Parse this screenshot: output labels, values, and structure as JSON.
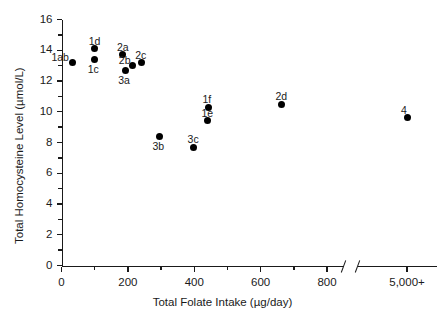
{
  "chart_data": {
    "type": "scatter",
    "title": "",
    "xlabel": "Total Folate Intake (µg/day)",
    "ylabel": "Total Homocysteine Level (µmol/L)",
    "xlim": [
      0,
      900
    ],
    "ylim": [
      0,
      16
    ],
    "grid": false,
    "legend": null,
    "axis_break": {
      "present": true,
      "after": 800,
      "resumes_at_label": "5,000+"
    },
    "x_ticks_major": [
      0,
      200,
      400,
      600,
      800
    ],
    "x_tick_labels": [
      "0",
      "200",
      "400",
      "600",
      "800",
      "5,000+"
    ],
    "x_ticks_minor": [
      100,
      300,
      500,
      700
    ],
    "y_ticks_major": [
      0,
      2,
      4,
      6,
      8,
      10,
      12,
      14,
      16
    ],
    "y_tick_labels": [
      "0",
      "2",
      "4",
      "6",
      "8",
      "10",
      "12",
      "14",
      "16"
    ],
    "y_ticks_minor": [
      1,
      3,
      5,
      7,
      9,
      11,
      13,
      15
    ],
    "points": [
      {
        "label": "1ab",
        "x": 33,
        "y": 13.2,
        "label_pos": "left"
      },
      {
        "label": "1d",
        "x": 100,
        "y": 14.1,
        "label_pos": "top"
      },
      {
        "label": "1c",
        "x": 100,
        "y": 13.4,
        "label_pos": "bottom"
      },
      {
        "label": "2a",
        "x": 185,
        "y": 13.7,
        "label_pos": "top"
      },
      {
        "label": "2b",
        "x": 215,
        "y": 13.0,
        "label_pos": "topleft"
      },
      {
        "label": "2c",
        "x": 240,
        "y": 13.2,
        "label_pos": "top"
      },
      {
        "label": "3a",
        "x": 192,
        "y": 12.7,
        "label_pos": "bottom"
      },
      {
        "label": "3b",
        "x": 295,
        "y": 8.4,
        "label_pos": "bottom"
      },
      {
        "label": "3c",
        "x": 398,
        "y": 7.7,
        "label_pos": "top"
      },
      {
        "label": "1e",
        "x": 440,
        "y": 9.4,
        "label_pos": "top"
      },
      {
        "label": "1f",
        "x": 443,
        "y": 10.3,
        "label_pos": "top"
      },
      {
        "label": "2d",
        "x": 663,
        "y": 10.5,
        "label_pos": "top"
      },
      {
        "label": "4",
        "x": 5000,
        "y": 9.6,
        "label_pos": "top"
      }
    ]
  }
}
